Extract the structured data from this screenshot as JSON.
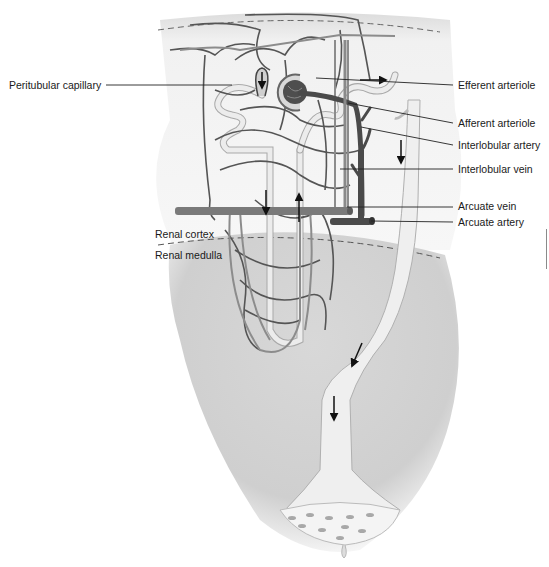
{
  "diagram": {
    "regions": {
      "cortex": "Renal cortex",
      "medulla": "Renal medulla"
    },
    "labels": [
      {
        "id": "peritubular-capillary",
        "text": "Peritubular capillary",
        "side": "left"
      },
      {
        "id": "efferent-arteriole",
        "text": "Efferent arteriole",
        "side": "right"
      },
      {
        "id": "afferent-arteriole",
        "text": "Afferent arteriole",
        "side": "right"
      },
      {
        "id": "interlobular-artery",
        "text": "Interlobular artery",
        "side": "right"
      },
      {
        "id": "interlobular-vein",
        "text": "Interlobular vein",
        "side": "right"
      },
      {
        "id": "arcuate-vein",
        "text": "Arcuate vein",
        "side": "right"
      },
      {
        "id": "arcuate-artery",
        "text": "Arcuate artery",
        "side": "right"
      }
    ],
    "colors": {
      "cortex_bg": "#f4f4f4",
      "medulla_bg": "#d2d2d2",
      "vessel_dark": "#555555",
      "vessel_mid": "#8c8c8c",
      "tubule": "#e8e8e8",
      "tubule_outline": "#a9a9a9",
      "arrow": "#111111"
    }
  }
}
